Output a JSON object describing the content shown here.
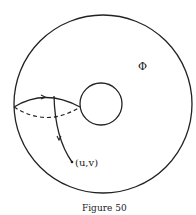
{
  "figure": {
    "caption": "Figure 50",
    "point_label": "(u,v)",
    "region_label": "Φ",
    "stroke_color": "#222222",
    "background": "#ffffff"
  }
}
